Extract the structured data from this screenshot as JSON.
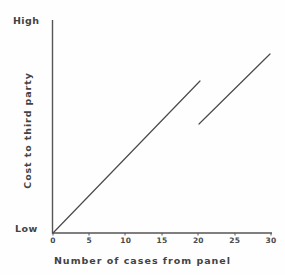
{
  "figure": {
    "background_color": "#fefefe",
    "ink_color": "#4a4a4a"
  },
  "axes": {
    "y": {
      "title": "Cost to third party",
      "low_label": "Low",
      "high_label": "High"
    },
    "x": {
      "title": "Number of cases from panel",
      "tick_labels": [
        "0",
        "5",
        "10",
        "15",
        "20",
        "25",
        "30"
      ]
    }
  },
  "chart_data": {
    "type": "line",
    "title": "",
    "xlabel": "Number of cases from panel",
    "ylabel": "Cost to third party",
    "xlim": [
      0,
      30
    ],
    "ylim": [
      0,
      100
    ],
    "ytick_labels": [
      "Low",
      "High"
    ],
    "xtick_labels": [
      "0",
      "5",
      "10",
      "15",
      "20",
      "25",
      "30"
    ],
    "grid": false,
    "legend": "none",
    "note": "Piecewise linear cost curve with a downward discontinuity (step drop) at 20 cases, then rising again at the same slope.",
    "series": [
      {
        "name": "cost-segment-1",
        "x": [
          0,
          20
        ],
        "y": [
          0,
          71
        ],
        "style": "solid"
      },
      {
        "name": "cost-segment-2",
        "x": [
          20,
          30
        ],
        "y": [
          51,
          84
        ],
        "style": "solid"
      }
    ]
  }
}
